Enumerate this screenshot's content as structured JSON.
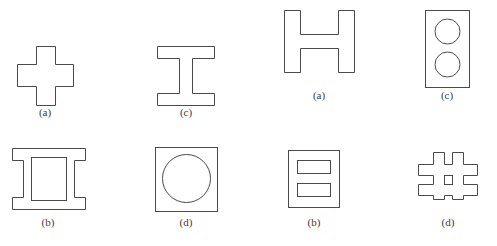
{
  "figure": {
    "background_color": "#ffffff",
    "stroke_color": "#4a4a4a",
    "label_color": "#3c3c3c",
    "shapes": [
      {
        "id": "cross-plus-section",
        "icon_name": "plus-cross-shape",
        "label": "(a)",
        "row": 1,
        "column": 1,
        "geometry_type": "solid-outline",
        "label_x": 45,
        "label_y": 112,
        "bbox": {
          "x": 17,
          "y": 46,
          "width": 57,
          "height": 59
        }
      },
      {
        "id": "i-beam-section",
        "icon_name": "i-beam-shape",
        "label": "(c)",
        "row": 1,
        "column": 2,
        "geometry_type": "solid-outline",
        "label_x": 186,
        "label_y": 112,
        "bbox": {
          "x": 157,
          "y": 46,
          "width": 58,
          "height": 59
        }
      },
      {
        "id": "h-section",
        "icon_name": "h-beam-shape",
        "label": "(a)",
        "row": 1,
        "column": 3,
        "geometry_type": "solid-outline",
        "label_x": 319,
        "label_y": 95,
        "bbox": {
          "x": 284,
          "y": 10,
          "width": 71,
          "height": 63
        }
      },
      {
        "id": "rect-two-holes-section",
        "icon_name": "rectangle-two-circular-holes-shape",
        "label": "(c)",
        "row": 1,
        "column": 4,
        "geometry_type": "outline-with-holes",
        "label_x": 447,
        "label_y": 95,
        "bbox": {
          "x": 425,
          "y": 10,
          "width": 45,
          "height": 78
        }
      },
      {
        "id": "hollow-i-box-section",
        "icon_name": "hollow-i-beam-shape",
        "label": "(b)",
        "row": 2,
        "column": 1,
        "geometry_type": "outline-with-holes",
        "label_x": 48,
        "label_y": 222,
        "bbox": {
          "x": 12,
          "y": 148,
          "width": 73,
          "height": 62
        }
      },
      {
        "id": "rect-one-hole-section",
        "icon_name": "rectangle-circular-hole-shape",
        "label": "(d)",
        "row": 2,
        "column": 2,
        "geometry_type": "outline-with-holes",
        "label_x": 186,
        "label_y": 222,
        "bbox": {
          "x": 155,
          "y": 147,
          "width": 63,
          "height": 65
        }
      },
      {
        "id": "square-two-slots-section",
        "icon_name": "square-two-slots-shape",
        "label": "(b)",
        "row": 2,
        "column": 3,
        "geometry_type": "outline-with-holes",
        "label_x": 314,
        "label_y": 222,
        "bbox": {
          "x": 288,
          "y": 150,
          "width": 52,
          "height": 58
        }
      },
      {
        "id": "hash-section",
        "icon_name": "hash-grid-shape",
        "label": "(d)",
        "row": 2,
        "column": 4,
        "geometry_type": "outline-with-holes",
        "label_x": 448,
        "label_y": 222,
        "bbox": {
          "x": 418,
          "y": 152,
          "width": 60,
          "height": 48
        }
      }
    ]
  }
}
